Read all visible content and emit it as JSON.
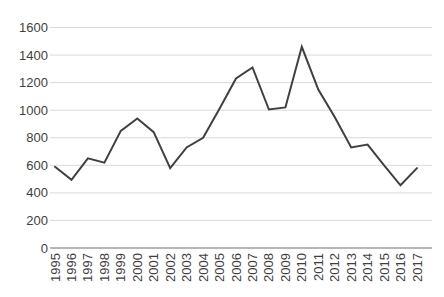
{
  "chart": {
    "background": "#ffffff",
    "series_color": "#404040",
    "gridline_color": "#d9d9d9",
    "axis_line_color": "#6e6e6e",
    "label_color": "#3f3f3f",
    "font_size_px": 13
  },
  "chart_data": {
    "type": "line",
    "title": "",
    "xlabel": "",
    "ylabel": "",
    "categories": [
      "1995",
      "1996",
      "1997",
      "1998",
      "1999",
      "2000",
      "2001",
      "2002",
      "2003",
      "2004",
      "2005",
      "2006",
      "2007",
      "2008",
      "2009",
      "2010",
      "2011",
      "2012",
      "2013",
      "2014",
      "2015",
      "2016",
      "2017"
    ],
    "values": [
      590,
      495,
      650,
      620,
      850,
      940,
      840,
      580,
      730,
      800,
      1010,
      1230,
      1310,
      1005,
      1020,
      1460,
      1150,
      950,
      730,
      750,
      600,
      455,
      580
    ],
    "ylim": [
      0,
      1600
    ],
    "ytick_step": 200,
    "ytick_labels": [
      "0",
      "200",
      "400",
      "600",
      "800",
      "1000",
      "1200",
      "1400",
      "1600"
    ],
    "grid": "horizontal",
    "legend": "none",
    "x_tick_label_rotation": -90
  }
}
